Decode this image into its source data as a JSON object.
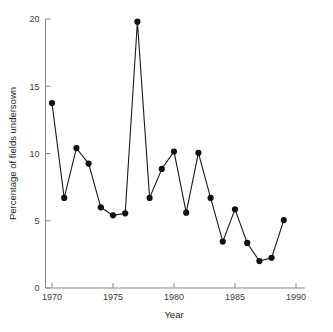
{
  "chart_data": {
    "type": "line",
    "title": "",
    "xlabel": "Year",
    "ylabel": "Percentage of fields undersown",
    "xlim": [
      1969,
      1990
    ],
    "ylim": [
      0,
      20
    ],
    "grid": false,
    "legend": "none",
    "x_ticks": [
      1970,
      1975,
      1980,
      1985,
      1990
    ],
    "x_tick_labels": [
      "1970",
      "1975",
      "1980",
      "1985",
      "1990"
    ],
    "y_ticks": [
      0,
      5,
      10,
      15,
      20
    ],
    "y_tick_labels": [
      "0",
      "5",
      "10",
      "15",
      "20"
    ],
    "marker": "filled-circle",
    "marker_color": "#111111",
    "line_color": "#1a1a1a",
    "axis_color": "#8a8a8a",
    "x": [
      1970,
      1971,
      1972,
      1973,
      1974,
      1975,
      1976,
      1977,
      1978,
      1979,
      1980,
      1981,
      1982,
      1983,
      1984,
      1985,
      1986,
      1987,
      1988,
      1989
    ],
    "values": [
      13.75,
      6.7,
      10.4,
      9.25,
      6.0,
      5.4,
      5.55,
      19.8,
      6.7,
      8.85,
      10.15,
      5.6,
      10.05,
      6.7,
      3.45,
      5.85,
      3.35,
      2.0,
      2.25,
      5.05
    ],
    "points": [
      {
        "year": 1970,
        "value": 13.75
      },
      {
        "year": 1971,
        "value": 6.7
      },
      {
        "year": 1972,
        "value": 10.4
      },
      {
        "year": 1973,
        "value": 9.25
      },
      {
        "year": 1974,
        "value": 6.0
      },
      {
        "year": 1975,
        "value": 5.4
      },
      {
        "year": 1976,
        "value": 5.55
      },
      {
        "year": 1977,
        "value": 19.8
      },
      {
        "year": 1978,
        "value": 6.7
      },
      {
        "year": 1979,
        "value": 8.85
      },
      {
        "year": 1980,
        "value": 10.15
      },
      {
        "year": 1981,
        "value": 5.6
      },
      {
        "year": 1982,
        "value": 10.05
      },
      {
        "year": 1983,
        "value": 6.7
      },
      {
        "year": 1984,
        "value": 3.45
      },
      {
        "year": 1985,
        "value": 5.85
      },
      {
        "year": 1986,
        "value": 3.35
      },
      {
        "year": 1987,
        "value": 2.0
      },
      {
        "year": 1988,
        "value": 2.25
      },
      {
        "year": 1989,
        "value": 5.05
      }
    ]
  }
}
